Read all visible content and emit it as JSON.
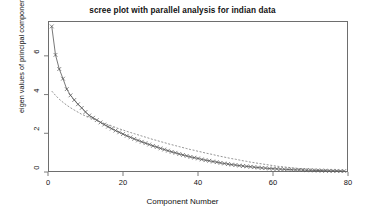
{
  "chart_data": {
    "type": "line",
    "title": "scree plot with parallel analysis for indian data",
    "xlabel": "Component Number",
    "ylabel": "eigen values of principal components",
    "xlim": [
      0,
      80
    ],
    "ylim": [
      0,
      7.8
    ],
    "xticks": [
      0,
      20,
      40,
      60,
      80
    ],
    "yticks": [
      0,
      2,
      4,
      6
    ],
    "grid": false,
    "legend": "none",
    "marker": "x",
    "x": [
      1,
      2,
      3,
      4,
      5,
      6,
      7,
      8,
      9,
      10,
      11,
      12,
      13,
      14,
      15,
      16,
      17,
      18,
      19,
      20,
      21,
      22,
      23,
      24,
      25,
      26,
      27,
      28,
      29,
      30,
      31,
      32,
      33,
      34,
      35,
      36,
      37,
      38,
      39,
      40,
      41,
      42,
      43,
      44,
      45,
      46,
      47,
      48,
      49,
      50,
      51,
      52,
      53,
      54,
      55,
      56,
      57,
      58,
      59,
      60,
      61,
      62,
      63,
      64,
      65,
      66,
      67,
      68,
      69,
      70,
      71,
      72,
      73,
      74,
      75,
      76,
      77,
      78,
      79
    ],
    "series": [
      {
        "name": "PC Actual Data",
        "style": "solid-with-x-markers",
        "color": "#555555",
        "values": [
          7.52,
          6.05,
          5.32,
          4.82,
          4.28,
          3.96,
          3.72,
          3.5,
          3.31,
          3.1,
          2.92,
          2.8,
          2.68,
          2.56,
          2.45,
          2.34,
          2.24,
          2.14,
          2.05,
          1.96,
          1.87,
          1.79,
          1.71,
          1.63,
          1.56,
          1.49,
          1.42,
          1.35,
          1.29,
          1.22,
          1.16,
          1.1,
          1.04,
          0.99,
          0.93,
          0.88,
          0.83,
          0.78,
          0.74,
          0.7,
          0.65,
          0.61,
          0.58,
          0.54,
          0.51,
          0.47,
          0.44,
          0.41,
          0.38,
          0.36,
          0.33,
          0.31,
          0.29,
          0.27,
          0.25,
          0.23,
          0.21,
          0.2,
          0.18,
          0.17,
          0.16,
          0.15,
          0.14,
          0.13,
          0.12,
          0.11,
          0.11,
          0.1,
          0.09,
          0.09,
          0.08,
          0.08,
          0.07,
          0.07,
          0.06,
          0.06,
          0.06,
          0.05,
          0.05
        ]
      },
      {
        "name": "Simulated Data (parallel analysis)",
        "style": "dashed",
        "color": "#7a7a7a",
        "values": [
          4.18,
          3.96,
          3.76,
          3.6,
          3.45,
          3.32,
          3.2,
          3.09,
          2.98,
          2.9,
          2.82,
          2.74,
          2.66,
          2.58,
          2.51,
          2.44,
          2.37,
          2.3,
          2.23,
          2.17,
          2.1,
          2.04,
          1.98,
          1.92,
          1.86,
          1.8,
          1.74,
          1.68,
          1.63,
          1.57,
          1.52,
          1.46,
          1.41,
          1.36,
          1.31,
          1.26,
          1.21,
          1.16,
          1.12,
          1.07,
          1.03,
          0.98,
          0.94,
          0.9,
          0.85,
          0.81,
          0.77,
          0.73,
          0.69,
          0.66,
          0.62,
          0.58,
          0.55,
          0.51,
          0.48,
          0.45,
          0.42,
          0.39,
          0.36,
          0.33,
          0.3,
          0.28,
          0.26,
          0.24,
          0.22,
          0.2,
          0.18,
          0.17,
          0.16,
          0.15,
          0.14,
          0.13,
          0.12,
          0.11,
          0.1,
          0.09,
          0.08,
          0.07,
          0.06
        ]
      }
    ]
  },
  "axes": {
    "xtick_labels": [
      "0",
      "20",
      "40",
      "60",
      "80"
    ],
    "ytick_labels": [
      "0",
      "2",
      "4",
      "6"
    ]
  },
  "colors": {
    "background": "#ffffff",
    "frame": "#6e6e6e",
    "text": "#111111",
    "series_actual": "#555555",
    "series_simulated": "#7a7a7a"
  }
}
